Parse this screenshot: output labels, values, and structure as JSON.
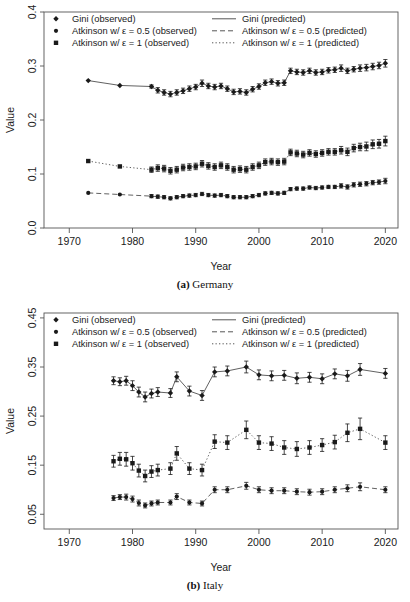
{
  "figure": {
    "panels": [
      {
        "id": "germany",
        "caption_label": "(a)",
        "caption_text": "Germany",
        "chart_data": {
          "type": "line",
          "title": "",
          "xlabel": "Year",
          "ylabel": "Value",
          "xlim": [
            1966,
            2022
          ],
          "ylim": [
            0.0,
            0.4
          ],
          "xticks": [
            1970,
            1980,
            1990,
            2000,
            2010,
            2020
          ],
          "xtick_labels": [
            "1970",
            "1980",
            "1990",
            "2000",
            "2010",
            "2020"
          ],
          "yticks": [
            0.0,
            0.1,
            0.2,
            0.3,
            0.4
          ],
          "ytick_labels": [
            "0.0",
            "0.1",
            "0.2",
            "0.3",
            "0.4"
          ],
          "grid": false,
          "legend_position": "top",
          "series": [
            {
              "name": "Gini",
              "marker": "diamond",
              "line_style": "solid",
              "x": [
                1973,
                1978,
                1983,
                1984,
                1985,
                1986,
                1987,
                1988,
                1989,
                1990,
                1991,
                1992,
                1993,
                1994,
                1995,
                1996,
                1997,
                1998,
                1999,
                2000,
                2001,
                2002,
                2003,
                2004,
                2005,
                2006,
                2007,
                2008,
                2009,
                2010,
                2011,
                2012,
                2013,
                2014,
                2015,
                2016,
                2017,
                2018,
                2019,
                2020
              ],
              "values": [
                0.273,
                0.264,
                0.262,
                0.255,
                0.251,
                0.248,
                0.251,
                0.254,
                0.258,
                0.261,
                0.268,
                0.263,
                0.261,
                0.263,
                0.258,
                0.252,
                0.253,
                0.251,
                0.257,
                0.262,
                0.269,
                0.271,
                0.268,
                0.269,
                0.291,
                0.289,
                0.288,
                0.291,
                0.288,
                0.289,
                0.292,
                0.293,
                0.296,
                0.291,
                0.294,
                0.296,
                0.297,
                0.299,
                0.301,
                0.305
              ],
              "err": [
                0.0,
                0.0,
                0.003,
                0.005,
                0.005,
                0.005,
                0.005,
                0.005,
                0.005,
                0.005,
                0.006,
                0.005,
                0.005,
                0.005,
                0.005,
                0.005,
                0.005,
                0.005,
                0.005,
                0.005,
                0.005,
                0.005,
                0.005,
                0.005,
                0.005,
                0.005,
                0.005,
                0.005,
                0.005,
                0.005,
                0.005,
                0.005,
                0.006,
                0.005,
                0.005,
                0.006,
                0.006,
                0.006,
                0.006,
                0.007
              ]
            },
            {
              "name": "Atkinson w/ e = 1",
              "marker": "square",
              "line_style": "dotted",
              "x": [
                1973,
                1978,
                1983,
                1984,
                1985,
                1986,
                1987,
                1988,
                1989,
                1990,
                1991,
                1992,
                1993,
                1994,
                1995,
                1996,
                1997,
                1998,
                1999,
                2000,
                2001,
                2002,
                2003,
                2004,
                2005,
                2006,
                2007,
                2008,
                2009,
                2010,
                2011,
                2012,
                2013,
                2014,
                2015,
                2016,
                2017,
                2018,
                2019,
                2020
              ],
              "values": [
                0.124,
                0.114,
                0.108,
                0.111,
                0.11,
                0.106,
                0.108,
                0.112,
                0.113,
                0.114,
                0.119,
                0.115,
                0.113,
                0.116,
                0.113,
                0.108,
                0.109,
                0.108,
                0.113,
                0.116,
                0.122,
                0.123,
                0.122,
                0.123,
                0.14,
                0.138,
                0.136,
                0.139,
                0.137,
                0.139,
                0.141,
                0.141,
                0.144,
                0.141,
                0.148,
                0.15,
                0.151,
                0.155,
                0.156,
                0.161
              ],
              "err": [
                0.0,
                0.0,
                0.005,
                0.006,
                0.006,
                0.006,
                0.006,
                0.006,
                0.006,
                0.006,
                0.006,
                0.006,
                0.006,
                0.006,
                0.006,
                0.006,
                0.006,
                0.006,
                0.006,
                0.006,
                0.006,
                0.006,
                0.006,
                0.006,
                0.006,
                0.006,
                0.006,
                0.006,
                0.006,
                0.006,
                0.006,
                0.006,
                0.007,
                0.007,
                0.007,
                0.007,
                0.008,
                0.008,
                0.008,
                0.009
              ]
            },
            {
              "name": "Atkinson w/ e = 0.5",
              "marker": "circle",
              "line_style": "dashed",
              "x": [
                1973,
                1978,
                1983,
                1984,
                1985,
                1986,
                1987,
                1988,
                1989,
                1990,
                1991,
                1992,
                1993,
                1994,
                1995,
                1996,
                1997,
                1998,
                1999,
                2000,
                2001,
                2002,
                2003,
                2004,
                2005,
                2006,
                2007,
                2008,
                2009,
                2010,
                2011,
                2012,
                2013,
                2014,
                2015,
                2016,
                2017,
                2018,
                2019,
                2020
              ],
              "values": [
                0.065,
                0.062,
                0.059,
                0.058,
                0.057,
                0.055,
                0.057,
                0.059,
                0.06,
                0.061,
                0.063,
                0.061,
                0.06,
                0.061,
                0.059,
                0.057,
                0.057,
                0.057,
                0.059,
                0.061,
                0.064,
                0.065,
                0.064,
                0.065,
                0.072,
                0.073,
                0.073,
                0.075,
                0.074,
                0.075,
                0.076,
                0.076,
                0.078,
                0.076,
                0.08,
                0.081,
                0.082,
                0.084,
                0.085,
                0.087
              ],
              "err": [
                0.0,
                0.0,
                0.003,
                0.003,
                0.003,
                0.003,
                0.003,
                0.003,
                0.003,
                0.003,
                0.003,
                0.003,
                0.003,
                0.003,
                0.003,
                0.003,
                0.003,
                0.003,
                0.003,
                0.003,
                0.003,
                0.003,
                0.003,
                0.003,
                0.003,
                0.003,
                0.003,
                0.003,
                0.003,
                0.003,
                0.003,
                0.003,
                0.004,
                0.004,
                0.004,
                0.004,
                0.004,
                0.004,
                0.004,
                0.005
              ]
            }
          ]
        }
      },
      {
        "id": "italy",
        "caption_label": "(b)",
        "caption_text": "Italy",
        "chart_data": {
          "type": "line",
          "title": "",
          "xlabel": "Year",
          "ylabel": "Value",
          "xlim": [
            1966,
            2022
          ],
          "ylim": [
            0.02,
            0.46
          ],
          "xticks": [
            1970,
            1980,
            1990,
            2000,
            2010,
            2020
          ],
          "xtick_labels": [
            "1970",
            "1980",
            "1990",
            "2000",
            "2010",
            "2020"
          ],
          "yticks": [
            0.05,
            0.15,
            0.25,
            0.35,
            0.45
          ],
          "ytick_labels": [
            "0.05",
            "0.15",
            "0.25",
            "0.35",
            "0.45"
          ],
          "grid": false,
          "legend_position": "top",
          "series": [
            {
              "name": "Gini",
              "marker": "diamond",
              "line_style": "solid",
              "x": [
                1977,
                1978,
                1979,
                1980,
                1981,
                1982,
                1983,
                1984,
                1986,
                1987,
                1989,
                1991,
                1993,
                1995,
                1998,
                2000,
                2002,
                2004,
                2006,
                2008,
                2010,
                2012,
                2014,
                2016,
                2020
              ],
              "values": [
                0.322,
                0.32,
                0.322,
                0.312,
                0.299,
                0.289,
                0.296,
                0.299,
                0.297,
                0.33,
                0.301,
                0.292,
                0.34,
                0.342,
                0.35,
                0.334,
                0.332,
                0.333,
                0.327,
                0.329,
                0.326,
                0.336,
                0.332,
                0.345,
                0.337
              ],
              "err": [
                0.008,
                0.008,
                0.009,
                0.01,
                0.01,
                0.01,
                0.009,
                0.009,
                0.009,
                0.01,
                0.01,
                0.01,
                0.01,
                0.01,
                0.012,
                0.01,
                0.01,
                0.01,
                0.011,
                0.01,
                0.01,
                0.01,
                0.011,
                0.012,
                0.01
              ]
            },
            {
              "name": "Atkinson w/ e = 1",
              "marker": "square",
              "line_style": "dotted",
              "x": [
                1977,
                1978,
                1979,
                1980,
                1981,
                1982,
                1983,
                1984,
                1986,
                1987,
                1989,
                1991,
                1993,
                1995,
                1998,
                2000,
                2002,
                2004,
                2006,
                2008,
                2010,
                2012,
                2014,
                2016,
                2020
              ],
              "values": [
                0.158,
                0.163,
                0.162,
                0.154,
                0.139,
                0.128,
                0.137,
                0.14,
                0.143,
                0.174,
                0.143,
                0.14,
                0.198,
                0.196,
                0.222,
                0.196,
                0.194,
                0.186,
                0.183,
                0.186,
                0.191,
                0.197,
                0.216,
                0.224,
                0.196
              ],
              "err": [
                0.012,
                0.013,
                0.014,
                0.014,
                0.013,
                0.012,
                0.012,
                0.012,
                0.012,
                0.014,
                0.012,
                0.012,
                0.014,
                0.014,
                0.018,
                0.014,
                0.014,
                0.014,
                0.015,
                0.014,
                0.013,
                0.014,
                0.018,
                0.022,
                0.014
              ]
            },
            {
              "name": "Atkinson w/ e = 0.5",
              "marker": "circle",
              "line_style": "dashed",
              "x": [
                1977,
                1978,
                1979,
                1980,
                1981,
                1982,
                1983,
                1984,
                1986,
                1987,
                1989,
                1991,
                1993,
                1995,
                1998,
                2000,
                2002,
                2004,
                2006,
                2008,
                2010,
                2012,
                2014,
                2016,
                2020
              ],
              "values": [
                0.083,
                0.085,
                0.085,
                0.081,
                0.073,
                0.068,
                0.072,
                0.074,
                0.074,
                0.086,
                0.074,
                0.072,
                0.1,
                0.1,
                0.108,
                0.1,
                0.098,
                0.098,
                0.096,
                0.095,
                0.096,
                0.1,
                0.103,
                0.106,
                0.1
              ],
              "err": [
                0.005,
                0.005,
                0.006,
                0.006,
                0.006,
                0.005,
                0.005,
                0.005,
                0.005,
                0.006,
                0.005,
                0.005,
                0.006,
                0.006,
                0.007,
                0.006,
                0.006,
                0.006,
                0.006,
                0.006,
                0.006,
                0.006,
                0.007,
                0.008,
                0.006
              ]
            }
          ]
        }
      }
    ],
    "legend": {
      "entries": [
        {
          "observed": "Gini (observed)",
          "predicted": "Gini (predicted)",
          "marker": "diamond",
          "line_style": "solid"
        },
        {
          "observed": "Atkinson w/ ε = 0.5 (observed)",
          "predicted": "Atkinson w/ ε = 0.5 (predicted)",
          "marker": "circle",
          "line_style": "dashed"
        },
        {
          "observed": "Atkinson w/ ε = 1 (observed)",
          "predicted": "Atkinson w/ ε = 1 (predicted)",
          "marker": "square",
          "line_style": "dotted"
        }
      ]
    },
    "colors": {
      "ink": "#1a1a1a",
      "axis": "#555555",
      "line": "#444444"
    }
  }
}
